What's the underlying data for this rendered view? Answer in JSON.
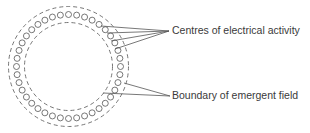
{
  "labels": {
    "centres": "Centres of electrical activity",
    "boundary": "Boundary of emergent field"
  },
  "figure": {
    "center": [
      68.5,
      66.5
    ],
    "outer_radius": 60,
    "inner_radius": 44,
    "dot_ring_radius": 52,
    "dot_count": 40,
    "dot_radius": 3,
    "stroke_color": "#555555"
  }
}
